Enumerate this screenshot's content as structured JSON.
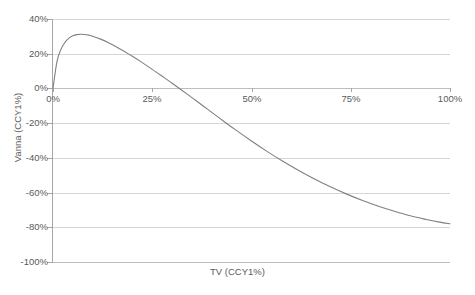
{
  "chart_data": {
    "type": "line",
    "title": "",
    "xlabel": "TV (CCY1%)",
    "ylabel": "Vanna (CCY1%)",
    "xlim": [
      0,
      100
    ],
    "ylim": [
      -100,
      40
    ],
    "xticklabels": [
      "0%",
      "25%",
      "50%",
      "75%",
      "100%"
    ],
    "xtickvalues": [
      0,
      25,
      50,
      75,
      100
    ],
    "yticklabels": [
      "40%",
      "20%",
      "0%",
      "-20%",
      "-40%",
      "-60%",
      "-80%",
      "-100%"
    ],
    "ytickvalues": [
      40,
      20,
      0,
      -20,
      -40,
      -60,
      -80,
      -100
    ],
    "grid": true,
    "legend": false,
    "series": [
      {
        "name": "Vanna",
        "color": "#808080",
        "x": [
          0,
          1,
          2,
          3,
          4,
          5,
          6,
          7,
          8,
          9,
          10,
          12,
          14,
          16,
          18,
          20,
          22,
          25,
          28,
          30,
          32,
          35,
          38,
          40,
          43,
          46,
          50,
          54,
          58,
          62,
          66,
          70,
          74,
          78,
          82,
          86,
          90,
          94,
          97,
          100
        ],
        "values": [
          0,
          15.5,
          22.5,
          26.5,
          29,
          30.3,
          31,
          31.2,
          31.1,
          30.7,
          30.1,
          28.4,
          26.3,
          23.9,
          21.3,
          18.5,
          15.6,
          11.0,
          6.2,
          3.0,
          -0.3,
          -5.3,
          -10.4,
          -13.8,
          -18.9,
          -23.9,
          -30.3,
          -36.4,
          -42.1,
          -47.4,
          -52.3,
          -56.8,
          -60.9,
          -64.6,
          -67.9,
          -70.8,
          -73.4,
          -75.5,
          -76.9,
          -78.0
        ]
      }
    ]
  },
  "axis": {
    "x_title": "TV (CCY1%)",
    "y_title": "Vanna (CCY1%)"
  },
  "colors": {
    "curve": "#808080",
    "gridline": "#d6d6d6",
    "axis": "#a6a6a6",
    "text": "#5a5a5a",
    "background": "#ffffff"
  }
}
